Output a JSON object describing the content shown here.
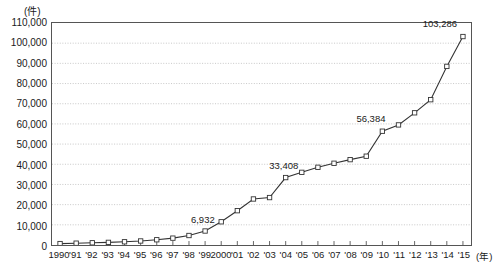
{
  "chart_data": {
    "type": "line",
    "title": "",
    "subtitle": "",
    "ylabel": "(件)",
    "xlabel": "(年)",
    "ylim": [
      0,
      110000
    ],
    "ytick_step": 10000,
    "grid": true,
    "legend": null,
    "marker": "open-square",
    "line_color": "#333333",
    "categories": [
      "1990",
      "'91",
      "'92",
      "'93",
      "'94",
      "'95",
      "'96",
      "'97",
      "'98",
      "'99",
      "2000",
      "'01",
      "'02",
      "'03",
      "'04",
      "'05",
      "'06",
      "'07",
      "'08",
      "'09",
      "'10",
      "'11",
      "'12",
      "'13",
      "'14",
      "'15"
    ],
    "x": [
      1990,
      1991,
      1992,
      1993,
      1994,
      1995,
      1996,
      1997,
      1998,
      1999,
      2000,
      2001,
      2002,
      2003,
      2004,
      2005,
      2006,
      2007,
      2008,
      2009,
      2010,
      2011,
      2012,
      2013,
      2014,
      2015
    ],
    "values": [
      700,
      900,
      1100,
      1300,
      1600,
      2000,
      2600,
      3400,
      4700,
      6932,
      11500,
      17000,
      22800,
      23500,
      33408,
      36000,
      38500,
      40500,
      42300,
      44000,
      56384,
      59500,
      65500,
      72000,
      88500,
      103286
    ],
    "ytick_labels": [
      "110,000",
      "100,000",
      "90,000",
      "80,000",
      "70,000",
      "60,000",
      "50,000",
      "40,000",
      "30,000",
      "20,000",
      "10,000",
      "0"
    ],
    "ytick_values": [
      110000,
      100000,
      90000,
      80000,
      70000,
      60000,
      50000,
      40000,
      30000,
      20000,
      10000,
      0
    ],
    "annotations": [
      {
        "label": "6,932",
        "x": 1999,
        "y": 6932,
        "dx": -2,
        "dy": -7
      },
      {
        "label": "33,408",
        "x": 2004,
        "y": 33408,
        "dx": -2,
        "dy": -7
      },
      {
        "label": "56,384",
        "x": 2010,
        "y": 56384,
        "dx": -12,
        "dy": -7
      },
      {
        "label": "103,286",
        "x": 2015,
        "y": 103286,
        "dx": -24,
        "dy": -7
      }
    ]
  }
}
